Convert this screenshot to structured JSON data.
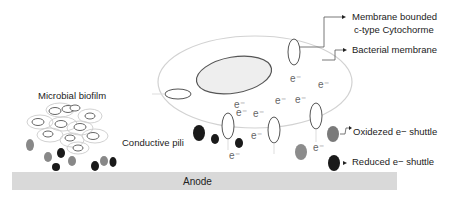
{
  "labels": {
    "membrane_cytochrome_line1": "Membrane bounded",
    "membrane_cytochrome_line2": "c-type Cytochorme",
    "bacterial_membrane": "Bacterial membrane",
    "microbial_biofilm": "Microbial biofilm",
    "conductive_pili": "Conductive pili",
    "oxidized_shuttle": "Oxidezed e− shuttle",
    "reduced_shuttle": "Reduced e− shuttle",
    "anode": "Anode"
  },
  "electron_symbol": "e⁻",
  "colors": {
    "anode_fill": "#d9d9d9",
    "cell_fill": "#eeeeee",
    "oxidized_shuttle": "#808080",
    "reduced_shuttle": "#1a1a1a",
    "outline": "#555555",
    "membrane": "#cfcfcf"
  }
}
